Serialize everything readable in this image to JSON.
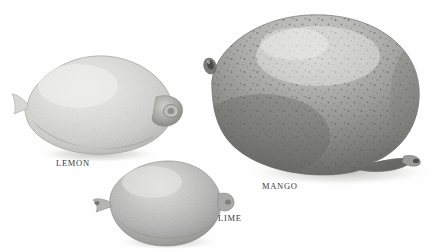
{
  "plate": {
    "title": "Fruit comparison plate",
    "background_color": "#fefefe",
    "width": 446,
    "height": 252,
    "style": "grayscale halftone photograph"
  },
  "captions": {
    "lemon": "LEMON",
    "mango": "MANGO",
    "lime": "LIME"
  },
  "caption_color": "#3a3a3a",
  "specimens": [
    {
      "name": "lemon",
      "label": "LEMON",
      "position": {
        "x": 18,
        "y": 50,
        "width": 158,
        "height": 110
      },
      "base_color": "#d6d6d4",
      "highlight_color": "#ececea",
      "shadow_color": "#9a9a98",
      "outline_color": "#8d8d8b",
      "surface": "smooth pebbled rind",
      "features": [
        "left nipple point",
        "right stem nub",
        "cast shadow below"
      ]
    },
    {
      "name": "mango",
      "label": "MANGO",
      "position": {
        "x": 200,
        "y": 12,
        "width": 222,
        "height": 168
      },
      "base_color": "#b9b9b7",
      "highlight_color": "#e2e2e0",
      "shadow_color": "#6f6f6d",
      "outline_color": "#7c7c7a",
      "surface": "speckled lenticel dots",
      "features": [
        "upper-left stem dimple",
        "lower-right beak",
        "dark mottled lower-left",
        "cast shadow right"
      ]
    },
    {
      "name": "lime",
      "label": "LIME",
      "position": {
        "x": 100,
        "y": 158,
        "width": 122,
        "height": 94
      },
      "base_color": "#bdbdbb",
      "highlight_color": "#dedede",
      "shadow_color": "#8b8b89",
      "outline_color": "#858583",
      "surface": "fine pitted rind",
      "features": [
        "left stem nub",
        "right blossom nub",
        "cropped at bottom edge"
      ]
    }
  ]
}
